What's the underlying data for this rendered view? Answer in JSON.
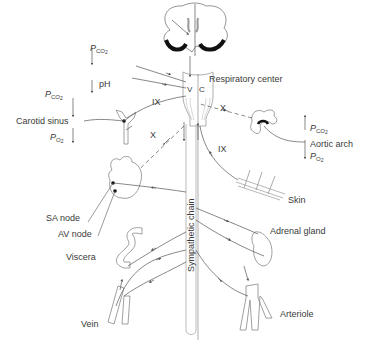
{
  "diagram": {
    "type": "physiology-schematic",
    "labels": {
      "respiratory_center": "Respiratory center",
      "carotid_sinus": "Carotid sinus",
      "aortic_arch": "Aortic arch",
      "skin": "Skin",
      "sa_node": "SA node",
      "av_node": "AV node",
      "viscera": "Viscera",
      "adrenal_gland": "Adrenal gland",
      "vein": "Vein",
      "arteriole": "Arteriole",
      "sympathetic_chain": "Sympathetic chain",
      "brainstem_v": "V",
      "brainstem_c": "C",
      "ph": "pH"
    },
    "partial_pressures": {
      "p": "P",
      "co2_main": "CO",
      "co2_sub": "2",
      "o2_main": "O",
      "o2_sub": "2"
    },
    "nerves": {
      "ix_carotid": "IX",
      "x_carotid": "X",
      "x_aortic": "X",
      "ix_skin": "IX"
    },
    "arrows": {
      "central_pco2": "up",
      "central_ph": "down",
      "carotid_pco2": "up",
      "carotid_po2": "down",
      "aortic_pco2": "up",
      "aortic_po2": "down"
    },
    "colors": {
      "line": "#555555",
      "text": "#3a3a3a",
      "dark_fill": "#111111",
      "outline": "#9a9a9a"
    }
  }
}
